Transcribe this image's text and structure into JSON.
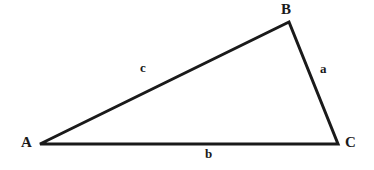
{
  "figure": {
    "name": "labeled-triangle",
    "background_color": "#ffffff",
    "stroke_color": "#1a1a1a",
    "stroke_width": 3
  },
  "vertices": [
    {
      "id": "A",
      "label": "A",
      "x": 40,
      "y": 144
    },
    {
      "id": "B",
      "label": "B",
      "x": 289,
      "y": 22
    },
    {
      "id": "C",
      "label": "C",
      "x": 338,
      "y": 144
    }
  ],
  "sides": [
    {
      "id": "a",
      "label": "a",
      "from": "B",
      "to": "C",
      "opposite_vertex": "A"
    },
    {
      "id": "b",
      "label": "b",
      "from": "A",
      "to": "C",
      "opposite_vertex": "B"
    },
    {
      "id": "c",
      "label": "c",
      "from": "A",
      "to": "B",
      "opposite_vertex": "C"
    }
  ],
  "chart_data": {
    "type": "diagram",
    "title": "",
    "shape": "triangle",
    "points": [
      {
        "name": "A",
        "x": 40,
        "y": 144
      },
      {
        "name": "B",
        "x": 289,
        "y": 22
      },
      {
        "name": "C",
        "x": 338,
        "y": 144
      }
    ],
    "edge_labels": {
      "a": "a",
      "b": "b",
      "c": "c"
    },
    "vertex_labels": {
      "A": "A",
      "B": "B",
      "C": "C"
    }
  }
}
